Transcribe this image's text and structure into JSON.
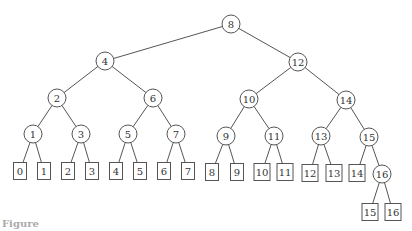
{
  "diagram": {
    "type": "binary-tree",
    "internal_nodes": [
      {
        "id": "i8",
        "label": "8",
        "x": 231,
        "y": 24
      },
      {
        "id": "i4",
        "label": "4",
        "x": 105,
        "y": 61
      },
      {
        "id": "i12",
        "label": "12",
        "x": 298,
        "y": 62
      },
      {
        "id": "i2",
        "label": "2",
        "x": 57,
        "y": 98
      },
      {
        "id": "i6",
        "label": "6",
        "x": 153,
        "y": 98
      },
      {
        "id": "i10",
        "label": "10",
        "x": 249,
        "y": 99
      },
      {
        "id": "i14",
        "label": "14",
        "x": 346,
        "y": 100
      },
      {
        "id": "i1",
        "label": "1",
        "x": 33,
        "y": 134
      },
      {
        "id": "i3",
        "label": "3",
        "x": 81,
        "y": 134
      },
      {
        "id": "i5",
        "label": "5",
        "x": 128,
        "y": 134
      },
      {
        "id": "i7",
        "label": "7",
        "x": 176,
        "y": 134
      },
      {
        "id": "i9",
        "label": "9",
        "x": 226,
        "y": 136
      },
      {
        "id": "i11",
        "label": "11",
        "x": 274,
        "y": 136
      },
      {
        "id": "i13",
        "label": "13",
        "x": 321,
        "y": 136
      },
      {
        "id": "i15",
        "label": "15",
        "x": 369,
        "y": 137
      },
      {
        "id": "i16",
        "label": "16",
        "x": 382,
        "y": 174
      }
    ],
    "leaves": [
      {
        "id": "l0",
        "label": "0",
        "x": 20,
        "y": 171
      },
      {
        "id": "l1",
        "label": "1",
        "x": 44,
        "y": 171
      },
      {
        "id": "l2",
        "label": "2",
        "x": 68,
        "y": 171
      },
      {
        "id": "l3",
        "label": "3",
        "x": 92,
        "y": 171
      },
      {
        "id": "l4",
        "label": "4",
        "x": 116,
        "y": 171
      },
      {
        "id": "l5",
        "label": "5",
        "x": 140,
        "y": 171
      },
      {
        "id": "l6",
        "label": "6",
        "x": 164,
        "y": 171
      },
      {
        "id": "l7",
        "label": "7",
        "x": 188,
        "y": 171
      },
      {
        "id": "l8",
        "label": "8",
        "x": 212,
        "y": 172
      },
      {
        "id": "l9",
        "label": "9",
        "x": 237,
        "y": 172
      },
      {
        "id": "l10",
        "label": "10",
        "x": 262,
        "y": 172
      },
      {
        "id": "l11",
        "label": "11",
        "x": 285,
        "y": 172
      },
      {
        "id": "l12",
        "label": "12",
        "x": 310,
        "y": 173
      },
      {
        "id": "l13",
        "label": "13",
        "x": 334,
        "y": 173
      },
      {
        "id": "l14",
        "label": "14",
        "x": 357,
        "y": 173
      },
      {
        "id": "l15",
        "label": "15",
        "x": 370,
        "y": 212
      },
      {
        "id": "l16",
        "label": "16",
        "x": 393,
        "y": 212
      }
    ],
    "edges": [
      [
        "i8",
        "i4"
      ],
      [
        "i8",
        "i12"
      ],
      [
        "i4",
        "i2"
      ],
      [
        "i4",
        "i6"
      ],
      [
        "i12",
        "i10"
      ],
      [
        "i12",
        "i14"
      ],
      [
        "i2",
        "i1"
      ],
      [
        "i2",
        "i3"
      ],
      [
        "i6",
        "i5"
      ],
      [
        "i6",
        "i7"
      ],
      [
        "i10",
        "i9"
      ],
      [
        "i10",
        "i11"
      ],
      [
        "i14",
        "i13"
      ],
      [
        "i14",
        "i15"
      ],
      [
        "i1",
        "l0"
      ],
      [
        "i1",
        "l1"
      ],
      [
        "i3",
        "l2"
      ],
      [
        "i3",
        "l3"
      ],
      [
        "i5",
        "l4"
      ],
      [
        "i5",
        "l5"
      ],
      [
        "i7",
        "l6"
      ],
      [
        "i7",
        "l7"
      ],
      [
        "i9",
        "l8"
      ],
      [
        "i9",
        "l9"
      ],
      [
        "i11",
        "l10"
      ],
      [
        "i11",
        "l11"
      ],
      [
        "i13",
        "l12"
      ],
      [
        "i13",
        "l13"
      ],
      [
        "i15",
        "l14"
      ],
      [
        "i15",
        "i16"
      ],
      [
        "i16",
        "l15"
      ],
      [
        "i16",
        "l16"
      ]
    ],
    "colors": {
      "stroke": "#555555",
      "text": "#333333",
      "background": "#ffffff"
    }
  },
  "caption": {
    "text": "Figure"
  }
}
